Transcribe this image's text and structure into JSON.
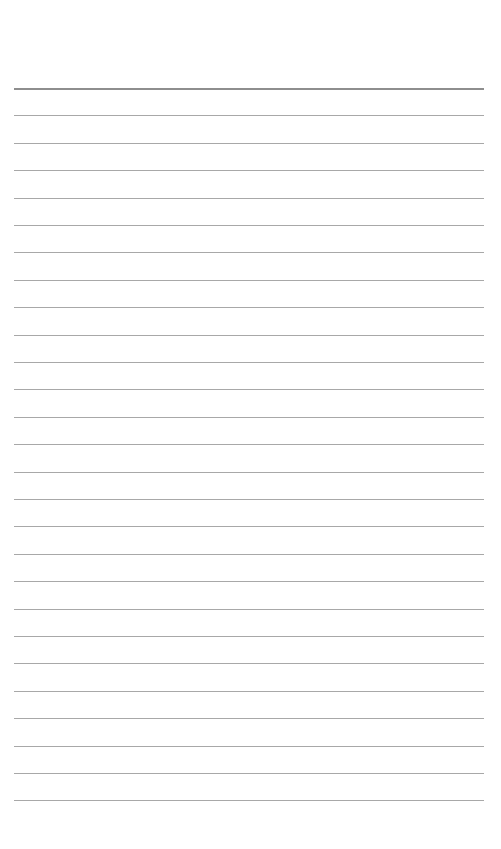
{
  "page": {
    "type": "lined-paper",
    "background_color": "#ffffff",
    "header_rule": {
      "y": 88,
      "thickness": 2,
      "color": "#8e8e8e"
    },
    "rules": {
      "count": 26,
      "start_y": 115.4,
      "spacing": 27.4,
      "thickness": 1,
      "color": "#a8a8a8",
      "x_start": 14,
      "x_end": 484
    }
  }
}
